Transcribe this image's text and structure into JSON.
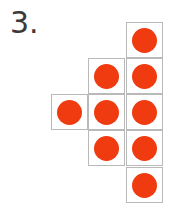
{
  "problem": {
    "number_label": "3."
  },
  "grid": {
    "dot_color": "#f03a10",
    "cells": [
      {
        "col": 2,
        "row": 0
      },
      {
        "col": 1,
        "row": 1
      },
      {
        "col": 2,
        "row": 1
      },
      {
        "col": 0,
        "row": 2
      },
      {
        "col": 1,
        "row": 2
      },
      {
        "col": 2,
        "row": 2
      },
      {
        "col": 1,
        "row": 3
      },
      {
        "col": 2,
        "row": 3
      },
      {
        "col": 2,
        "row": 4
      }
    ],
    "total_dots": 9
  }
}
